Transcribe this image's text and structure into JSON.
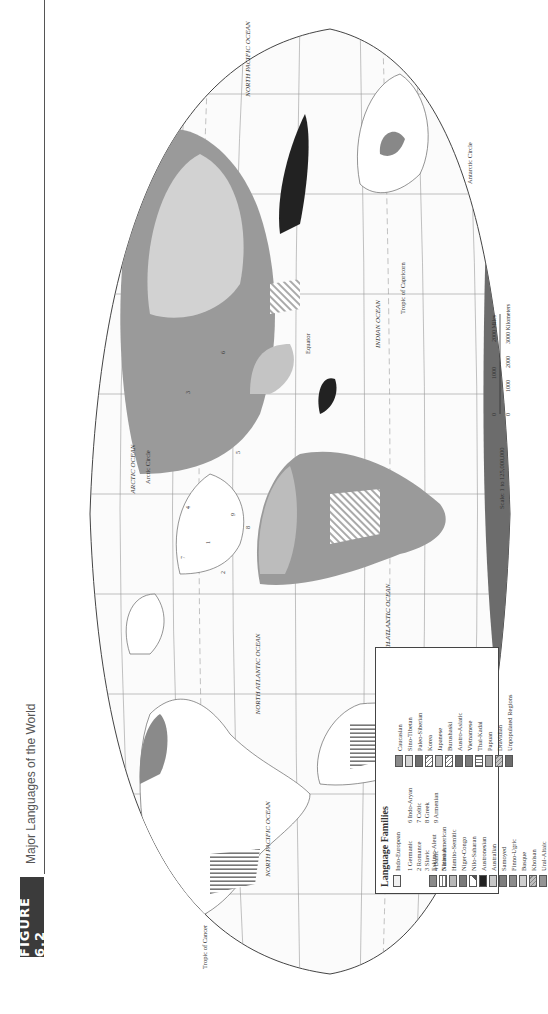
{
  "header": {
    "figure_label": "FIGURE 6.2",
    "title": "Major Languages of the World"
  },
  "map": {
    "labels": {
      "north_pacific_east": "NORTH PACIFIC OCEAN",
      "north_pacific_west": "NORTH PACIFIC OCEAN",
      "north_atlantic": "NORTH ATLANTIC OCEAN",
      "south_atlantic": "SOUTH ATLANTIC OCEAN",
      "south_pacific": "SOUTH PACIFIC OCEAN",
      "arctic": "ARCTIC OCEAN",
      "indian": "INDIAN OCEAN",
      "arctic_circle": "Arctic Circle",
      "antarctic_circle": "Antarctic Circle",
      "equator": "Equator",
      "tropic_cancer": "Tropic of Cancer",
      "tropic_capricorn": "Tropic of Capricorn"
    },
    "scale": {
      "text": "Scale: 1 to 125,000,000",
      "miles": [
        "0",
        "1000",
        "2000 Miles"
      ],
      "km": [
        "0",
        "1000",
        "2000",
        "3000 Kilometers"
      ]
    },
    "region_numbers": [
      "1",
      "2",
      "3",
      "4",
      "5",
      "6",
      "7",
      "8",
      "9"
    ]
  },
  "legend": {
    "title": "Language Families",
    "indo_european": {
      "label": "Indo-European",
      "subgroups_left": [
        "1  Germanic",
        "2  Romance",
        "3  Slavic",
        "4  Baltic",
        "5  Iranian"
      ],
      "subgroups_right": [
        "6  Indo-Aryan",
        "7  Celtic",
        "8  Greek",
        "9  Armenian"
      ]
    },
    "column1": [
      {
        "label": "Eskimo-Aleut",
        "fill": "#8a8a8a",
        "pattern": "solid"
      },
      {
        "label": "Native American",
        "fill": "#a8a8a8",
        "pattern": "hstripe"
      },
      {
        "label": "Hamito-Semitic",
        "fill": "#b8b8b8",
        "pattern": "solid"
      },
      {
        "label": "Niger-Congo",
        "fill": "#7a7a7a",
        "pattern": "solid"
      },
      {
        "label": "Nilo-Saharan",
        "fill": "#ffffff",
        "pattern": "corner"
      },
      {
        "label": "Austronesian",
        "fill": "#222222",
        "pattern": "solid"
      },
      {
        "label": "Australian",
        "fill": "#c8c8c8",
        "pattern": "solid"
      },
      {
        "label": "Samoyed",
        "fill": "#7e7e7e",
        "pattern": "solid"
      },
      {
        "label": "Finno-Ugric",
        "fill": "#8c8c8c",
        "pattern": "solid"
      },
      {
        "label": "Basque",
        "fill": "#cfcfcf",
        "pattern": "solid"
      },
      {
        "label": "Khoisan",
        "fill": "#bdbdbd",
        "pattern": "diag"
      },
      {
        "label": "Ural-Altaic",
        "fill": "#949494",
        "pattern": "solid"
      }
    ],
    "column2": [
      {
        "label": "Caucasian",
        "fill": "#8a8a8a",
        "pattern": "solid"
      },
      {
        "label": "Sino-Tibetan",
        "fill": "#d4d4d4",
        "pattern": "solid"
      },
      {
        "label": "Paleo-Siberian",
        "fill": "#6e6e6e",
        "pattern": "solid"
      },
      {
        "label": "Korea",
        "fill": "#ffffff",
        "pattern": "diag"
      },
      {
        "label": "Japanese",
        "fill": "#b4b4b4",
        "pattern": "solid"
      },
      {
        "label": "Burushaski",
        "fill": "#ffffff",
        "pattern": "diag"
      },
      {
        "label": "Austro-Asiatic",
        "fill": "#6a6a6a",
        "pattern": "solid"
      },
      {
        "label": "Vietnamese",
        "fill": "#7a7a7a",
        "pattern": "solid"
      },
      {
        "label": "Thai-Kadai",
        "fill": "#ffffff",
        "pattern": "vstripe"
      },
      {
        "label": "Papuan",
        "fill": "#a0a0a0",
        "pattern": "solid"
      },
      {
        "label": "Dravidian",
        "fill": "#c4c4c4",
        "pattern": "diag"
      },
      {
        "label": "Unpopulated Regions",
        "fill": "#6c6c6c",
        "pattern": "solid"
      }
    ]
  }
}
